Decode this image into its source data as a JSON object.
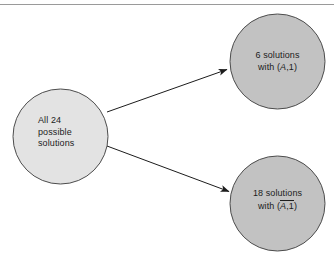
{
  "diagram": {
    "type": "flow",
    "title": "",
    "colors": {
      "source_fill": "#e3e3e3",
      "target_fill": "#c2c2c2",
      "stroke": "#4d4d4d",
      "arrow": "#1c1c1c",
      "text": "#1c1c1c",
      "rule": "#9a9a9a"
    },
    "nodes": [
      {
        "id": "source",
        "shape": "circle",
        "role": "source",
        "cx": 60.5,
        "cy": 136.5,
        "r": 47.5,
        "fill": "#e3e3e3",
        "text_align": "left",
        "lines": [
          "All 24",
          "possible",
          "solutions"
        ]
      },
      {
        "id": "target-top",
        "shape": "circle",
        "role": "target",
        "cx": 277.5,
        "cy": 61.5,
        "r": 47.5,
        "fill": "#c2c2c2",
        "text_align": "center",
        "lines": [
          "6 solutions",
          "with (A,1)"
        ],
        "line1": "6 solutions",
        "with_prefix": "with (",
        "variable": "A",
        "overbar": false,
        "tuple_rest": ",1",
        "with_suffix": ")"
      },
      {
        "id": "target-bottom",
        "shape": "circle",
        "role": "target",
        "cx": 277.5,
        "cy": 203.5,
        "r": 47.5,
        "fill": "#c2c2c2",
        "text_align": "center",
        "lines": [
          "18 solutions",
          "with (A,1)"
        ],
        "line1": "18 solutions",
        "with_prefix": "with (",
        "variable": "A",
        "overbar": true,
        "tuple_rest": ",1",
        "with_suffix": ")"
      }
    ],
    "edges": [
      {
        "id": "edge-top",
        "from": "source",
        "to": "target-top",
        "label": "",
        "x1": 107,
        "y1": 112,
        "x2": 228,
        "y2": 69,
        "arrowhead": "filled"
      },
      {
        "id": "edge-bottom",
        "from": "source",
        "to": "target-bottom",
        "label": "",
        "x1": 107,
        "y1": 146,
        "x2": 230,
        "y2": 192,
        "arrowhead": "filled"
      }
    ]
  }
}
